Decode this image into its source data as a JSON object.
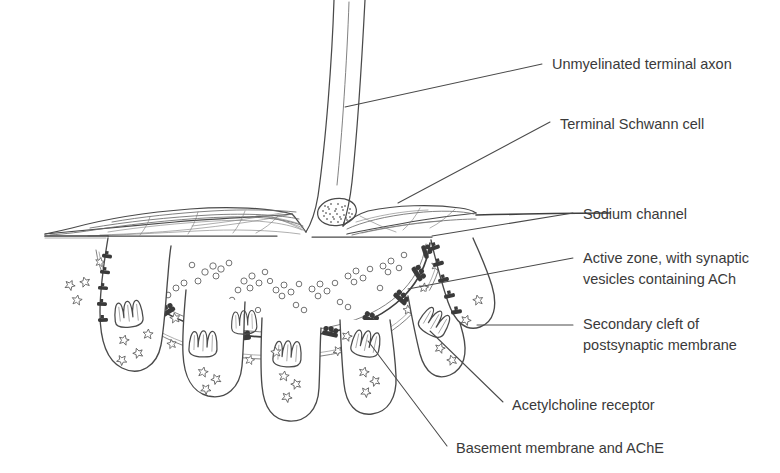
{
  "figure": {
    "background": "#ffffff",
    "ink_color": "#4a4a4a",
    "text_color": "#3a3a3a",
    "width": 780,
    "height": 473
  },
  "labels": [
    {
      "id": "unmyelinated-terminal-axon",
      "text": "Unmyelinated terminal axon",
      "x": 552,
      "y": 65,
      "leader": {
        "x1": 345,
        "y1": 107,
        "x2": 542,
        "y2": 64
      }
    },
    {
      "id": "terminal-schwann-cell",
      "text": "Terminal Schwann cell",
      "x": 560,
      "y": 125,
      "leader": {
        "x1": 398,
        "y1": 203,
        "x2": 550,
        "y2": 122
      }
    },
    {
      "id": "sodium-channel",
      "text": "Sodium channel",
      "x": 583,
      "y": 215,
      "leader": {
        "x1": 432,
        "y1": 236,
        "x2": 573,
        "y2": 213
      }
    },
    {
      "id": "active-zone",
      "text": "Active zone, with synaptic",
      "text2": "vesicles containing ACh",
      "x": 583,
      "y": 259,
      "leader": {
        "x1": 408,
        "y1": 289,
        "x2": 573,
        "y2": 258
      }
    },
    {
      "id": "secondary-cleft",
      "text": "Secondary cleft of",
      "text2": "postsynaptic membrane",
      "x": 583,
      "y": 325,
      "leader": {
        "x1": 477,
        "y1": 325,
        "x2": 573,
        "y2": 325
      }
    },
    {
      "id": "acetylcholine-receptor",
      "text": "Acetylcholine receptor",
      "x": 512,
      "y": 406,
      "leader": {
        "x1": 430,
        "y1": 331,
        "x2": 503,
        "y2": 402
      }
    },
    {
      "id": "basement-membrane",
      "text": "Basement membrane and AChE",
      "x": 456,
      "y": 449,
      "leader": {
        "x1": 368,
        "y1": 341,
        "x2": 447,
        "y2": 446
      }
    }
  ],
  "structures": {
    "axon": {
      "name": "unmyelinated terminal axon",
      "description": "descends from top of figure, flares into presynaptic bouton"
    },
    "schwann_cell": {
      "name": "terminal Schwann cell",
      "description": "flattened cell capping the nerve terminal, with stippled nucleus"
    },
    "schwann_nucleus": {
      "cx": 337,
      "cy": 212,
      "rx": 19,
      "ry": 13
    },
    "bouton": {
      "name": "presynaptic nerve terminal",
      "description": "dome-shaped synaptic bouton"
    },
    "synaptic_vesicles": {
      "count": 46,
      "description": "small open circles containing ACh"
    },
    "active_zones": {
      "count": 12,
      "description": "dark thickenings on presynaptic membrane"
    },
    "basement_membrane": {
      "description": "wavy double line in synaptic cleft carrying AChE"
    },
    "secondary_clefts": {
      "count": 7,
      "description": "junctional folds of postsynaptic membrane"
    },
    "acetylcholine_receptors": {
      "description": "star-shaped glyphs on crests of folds and in clefts"
    },
    "sodium_channels": {
      "description": "dark tick marks along the depths of the junctional folds"
    },
    "muscle_surface": {
      "description": "sarcolemma extending left and right of the endplate"
    }
  }
}
